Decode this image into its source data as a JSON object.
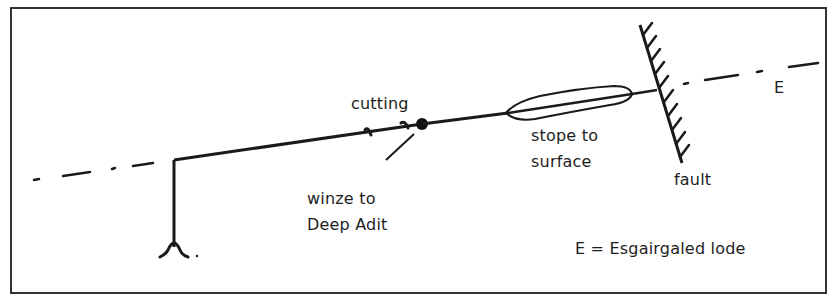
{
  "diagram": {
    "type": "mine plan sketch",
    "labels": {
      "cutting": "cutting",
      "winze_line1": "winze to",
      "winze_line2": "Deep Adit",
      "stope_line1": "stope to",
      "stope_line2": "surface",
      "fault": "fault",
      "lode_marker": "E",
      "legend": "E = Esgairgaled lode"
    },
    "colors": {
      "ink": "#1a1a1a",
      "background": "#ffffff",
      "frame": "#333333"
    }
  }
}
